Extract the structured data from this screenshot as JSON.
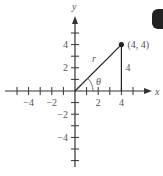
{
  "diagram": {
    "title": "",
    "axes": {
      "x_label": "x",
      "y_label": "y",
      "x_ticks": [
        -5,
        -4,
        -3,
        -2,
        -1,
        1,
        2,
        3,
        4,
        5
      ],
      "y_ticks": [
        -6,
        -5,
        -4,
        -3,
        -2,
        -1,
        1,
        2,
        3,
        4,
        5
      ],
      "x_tick_labels": [
        {
          "value": -4,
          "text": "−4"
        },
        {
          "value": -2,
          "text": "−2"
        },
        {
          "value": 2,
          "text": "2"
        },
        {
          "value": 4,
          "text": "4"
        }
      ],
      "y_tick_labels": [
        {
          "value": 4,
          "text": "4"
        },
        {
          "value": 2,
          "text": "2"
        },
        {
          "value": -2,
          "text": "−2"
        },
        {
          "value": -4,
          "text": "−4"
        }
      ]
    },
    "point": {
      "x": 4,
      "y": 4,
      "label": "(4, 4)"
    },
    "segment_r_label": "r",
    "angle_label": "θ",
    "vertical_leg_label": "4",
    "colors": {
      "axis": "#333333",
      "line": "#222222",
      "label": "#555555",
      "point": "#222222"
    }
  }
}
